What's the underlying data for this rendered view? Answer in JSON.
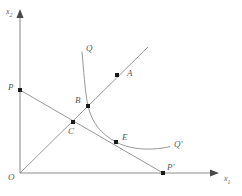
{
  "figure": {
    "type": "geometric-diagram",
    "axes": {
      "x": {
        "label": "x",
        "subscript": "1"
      },
      "y": {
        "label": "x",
        "subscript": "2"
      },
      "origin_label": "O"
    },
    "colors": {
      "line": "#8c8c8c",
      "axis": "#8c8c8c",
      "point": "#1a1a1a",
      "text": "#5a5a5a",
      "background": "#ffffff"
    },
    "labels": {
      "O": "O",
      "A": "A",
      "B": "B",
      "C": "C",
      "E": "E",
      "P": "P",
      "P_prime": "P'",
      "Q": "Q",
      "Q_prime": "Q'",
      "x_axis": "x",
      "x_axis_sub": "1",
      "y_axis": "x",
      "y_axis_sub": "2"
    },
    "points": [
      {
        "name": "O",
        "label": "O",
        "x": 20,
        "y": 173,
        "marker": false
      },
      {
        "name": "P",
        "label": "P",
        "x": 20,
        "y": 90,
        "marker": true
      },
      {
        "name": "C",
        "label": "C",
        "x": 73,
        "y": 122,
        "marker": true
      },
      {
        "name": "B",
        "label": "B",
        "x": 88,
        "y": 106,
        "marker": true
      },
      {
        "name": "E",
        "label": "E",
        "x": 116,
        "y": 142,
        "marker": true
      },
      {
        "name": "A",
        "label": "A",
        "x": 117,
        "y": 75,
        "marker": true
      },
      {
        "name": "P_prime",
        "label": "P'",
        "x": 163,
        "y": 173,
        "marker": true
      }
    ],
    "curves": [
      {
        "name": "isoquant",
        "start_label": "Q",
        "end_label": "Q'",
        "description": "convex-to-origin isoquant passing through B and E"
      }
    ],
    "lines": [
      {
        "name": "budget-line",
        "from": "P",
        "to": "P_prime"
      },
      {
        "name": "expansion-ray",
        "from": "O",
        "to": "A"
      }
    ]
  }
}
